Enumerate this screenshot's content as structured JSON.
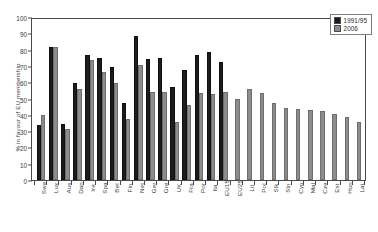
{
  "chart_data": {
    "type": "bar",
    "title": "",
    "xlabel": "",
    "ylabel": "% in favour of EU membership",
    "ylim": [
      0,
      100
    ],
    "yticks": [
      0,
      10,
      20,
      30,
      40,
      50,
      60,
      70,
      80,
      90,
      100
    ],
    "grid": false,
    "legend_position": "top-right",
    "categories": [
      "Swe",
      "Lux",
      "Aus",
      "Dan",
      "Ire",
      "Spa",
      "Bel",
      "Fin",
      "Net",
      "Ger",
      "Gre",
      "UK",
      "Fra",
      "Por",
      "Ita",
      "EU15",
      "EU25",
      "Lit",
      "Pol",
      "Slk",
      "Sln",
      "Cyp",
      "Mal",
      "Cze",
      "Est",
      "Hun",
      "Lat"
    ],
    "series": [
      {
        "name": "1991/95",
        "color": "#1c1c1c",
        "values": [
          34,
          81.5,
          34.5,
          59.5,
          77,
          75,
          69.5,
          47,
          88.5,
          74,
          75,
          57,
          67.5,
          77,
          78.5,
          72.5,
          null,
          null,
          null,
          null,
          null,
          null,
          null,
          null,
          null,
          null,
          null
        ]
      },
      {
        "name": "2006",
        "color": "#8d8d8d",
        "values": [
          40,
          81.5,
          31.5,
          56,
          73.5,
          66,
          59.5,
          37.5,
          70.5,
          54,
          54,
          35.5,
          46,
          53.5,
          52.5,
          54,
          50,
          56,
          53.5,
          47,
          44,
          43.5,
          43,
          42.5,
          40.5,
          38.5,
          35.5
        ]
      }
    ]
  },
  "legend": {
    "items": [
      {
        "label": "1991/95"
      },
      {
        "label": "2006"
      }
    ]
  }
}
